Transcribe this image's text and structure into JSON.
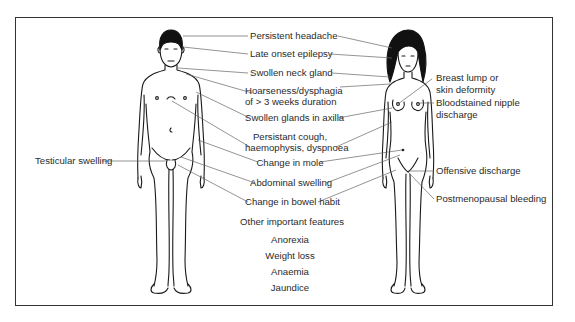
{
  "diagram": {
    "type": "anatomical-labeled-figures",
    "figures": [
      "male-figure",
      "female-figure"
    ],
    "labels_center": {
      "persistent_headache": "Persistent headache",
      "late_onset_epilepsy": "Late onset epilepsy",
      "swollen_neck_gland": "Swollen neck gland",
      "hoarseness_line1": "Hoarseness/dysphagia",
      "hoarseness_line2": "of > 3 weeks duration",
      "swollen_glands_axilla": "Swollen glands in axilla",
      "cough_line1": "Persistant cough,",
      "cough_line2": "haemophysis, dyspnoea",
      "change_in_mole": "Change in mole",
      "abdominal_swelling": "Abdominal swelling",
      "change_in_bowel_habit": "Change in bowel habit"
    },
    "labels_left": {
      "testicular_swelling": "Testicular swelling"
    },
    "labels_right": {
      "breast_line1": "Breast lump or",
      "breast_line2": "skin deformity",
      "nipple_line1": "Bloodstained nipple",
      "nipple_line2": "discharge",
      "offensive_discharge": "Offensive discharge",
      "postmenopausal_bleeding": "Postmenopausal bleeding"
    },
    "other_features": {
      "heading": "Other important features",
      "items": [
        "Anorexia",
        "Weight loss",
        "Anaemia",
        "Jaundice"
      ]
    },
    "colors": {
      "outline": "#1a1a1a",
      "leader_line": "#666666",
      "text": "#2b2b2b",
      "frame": "#333333"
    }
  }
}
